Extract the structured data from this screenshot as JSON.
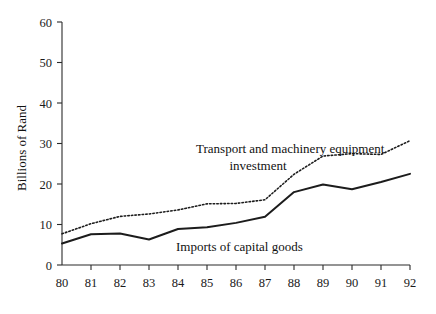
{
  "chart_data": {
    "type": "line",
    "title": "",
    "xlabel": "",
    "ylabel": "Billions of Rand",
    "categories": [
      "80",
      "81",
      "82",
      "83",
      "84",
      "85",
      "86",
      "87",
      "88",
      "89",
      "90",
      "91",
      "92"
    ],
    "x": [
      80,
      81,
      82,
      83,
      84,
      85,
      86,
      87,
      88,
      89,
      90,
      91,
      92
    ],
    "xlim": [
      80,
      92
    ],
    "ylim": [
      0,
      60
    ],
    "yticks": [
      0,
      10,
      20,
      30,
      40,
      50,
      60
    ],
    "ytick_labels": [
      "0",
      "10",
      "20",
      "30",
      "40",
      "50",
      "60"
    ],
    "xtick_labels": [
      "80",
      "81",
      "82",
      "83",
      "84",
      "85",
      "86",
      "87",
      "88",
      "89",
      "90",
      "91",
      "92"
    ],
    "grid": false,
    "legend": "inline-annotations",
    "series": [
      {
        "name": "Transport and machinery equipment investment",
        "style": "dotted",
        "color": "#1c1c1c",
        "values": [
          7.7,
          10.2,
          12.0,
          12.6,
          13.6,
          15.1,
          15.2,
          16.1,
          22.4,
          26.9,
          27.5,
          27.3,
          30.7
        ]
      },
      {
        "name": "Imports of capital goods",
        "style": "solid",
        "color": "#1c1c1c",
        "values": [
          5.3,
          7.6,
          7.8,
          6.3,
          8.9,
          9.3,
          10.4,
          11.9,
          18.0,
          19.9,
          18.7,
          20.5,
          22.5
        ]
      }
    ],
    "annotations": [
      {
        "id": "transport-label-line1",
        "text": "Transport and machinery equipment"
      },
      {
        "id": "transport-label-line2",
        "text": "investment"
      },
      {
        "id": "imports-label",
        "text": "Imports of capital goods"
      }
    ]
  }
}
